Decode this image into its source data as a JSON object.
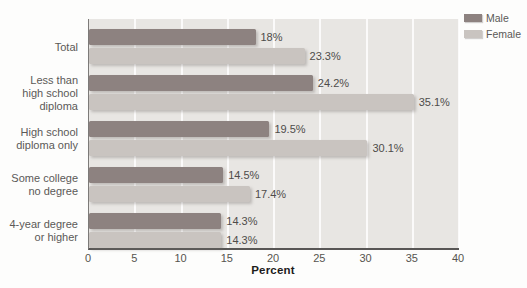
{
  "figure": {
    "background": "#fdfdfc",
    "plot_background": "#e8e6e3",
    "axis_color": "#585655",
    "gridline_color": "#ffffff",
    "text_color": "#5b5957"
  },
  "legend": {
    "items": [
      {
        "label": "Male",
        "color": "#8d8280"
      },
      {
        "label": "Female",
        "color": "#c9c4c0"
      }
    ]
  },
  "chart_data": {
    "type": "bar",
    "orientation": "horizontal",
    "title": "",
    "xlabel": "Percent",
    "ylabel": "",
    "xlim": [
      0,
      40
    ],
    "xticks": [
      0,
      5,
      10,
      15,
      20,
      25,
      30,
      35,
      40
    ],
    "grid": "vertical-white-gridlines",
    "legend_position": "top-right-outside",
    "categories": [
      "Total",
      "Less than\nhigh school\ndiploma",
      "High school\ndiploma only",
      "Some college\nno degree",
      "4-year degree\nor higher"
    ],
    "series": [
      {
        "name": "Male",
        "color": "#8d8280",
        "values": [
          18,
          24.2,
          19.5,
          14.5,
          14.3
        ],
        "labels": [
          "18%",
          "24.2%",
          "19.5%",
          "14.5%",
          "14.3%"
        ]
      },
      {
        "name": "Female",
        "color": "#c9c4c0",
        "values": [
          23.3,
          35.1,
          30.1,
          17.4,
          14.3
        ],
        "labels": [
          "23.3%",
          "35.1%",
          "30.1%",
          "17.4%",
          "14.3%"
        ]
      }
    ]
  }
}
